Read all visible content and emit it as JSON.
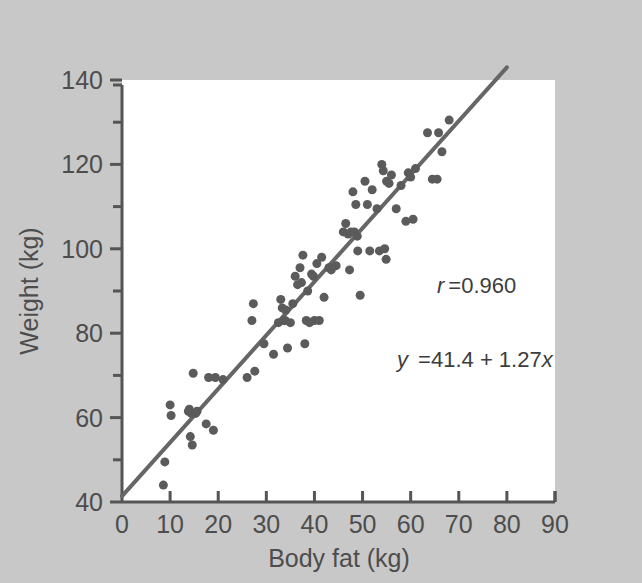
{
  "figure": {
    "name": "body-fat-vs-weight-scatterplot",
    "background_color": "#c8c8c8",
    "plot_background_color": "#ffffff",
    "point_color": "#5b5b5b",
    "line_color": "#666666",
    "axis_color": "#555555"
  },
  "annotations": {
    "correlation": "r =0.960",
    "correlation_symbol": "r",
    "correlation_value": "=0.960",
    "regression_equation": "y =41.4 + 1.27x",
    "regression_y": "y",
    "regression_rest": " =41.4 + 1.27",
    "regression_x": "x"
  },
  "chart_data": {
    "type": "scatter",
    "title": "",
    "xlabel": "Body fat (kg)",
    "ylabel": "Weight (kg)",
    "xlim": [
      0,
      90
    ],
    "ylim": [
      40,
      140
    ],
    "xticks": [
      0,
      10,
      20,
      30,
      40,
      50,
      60,
      70,
      80,
      90
    ],
    "xtick_labels": [
      "0",
      "10",
      "20",
      "30",
      "40",
      "50",
      "60",
      "70",
      "80",
      "90"
    ],
    "yticks": [
      40,
      60,
      80,
      100,
      120,
      140
    ],
    "ytick_labels": [
      "40",
      "60",
      "80",
      "100",
      "120",
      "140"
    ],
    "y_minor_ticks": [
      50,
      70,
      90,
      110,
      130
    ],
    "grid": false,
    "legend": false,
    "correlation_r": 0.96,
    "regression": {
      "intercept": 41.4,
      "slope": 1.27,
      "x_start": 0,
      "x_end": 80,
      "equation": "y = 41.4 + 1.27x"
    },
    "marker_size_px": 9,
    "n_points": 86,
    "points": [
      [
        8.6,
        44.0
      ],
      [
        8.9,
        49.5
      ],
      [
        10.0,
        63.0
      ],
      [
        10.2,
        60.5
      ],
      [
        13.8,
        61.5
      ],
      [
        14.0,
        62.0
      ],
      [
        14.2,
        55.5
      ],
      [
        14.4,
        61.0
      ],
      [
        14.6,
        53.5
      ],
      [
        14.8,
        70.5
      ],
      [
        15.3,
        61.0
      ],
      [
        15.6,
        61.5
      ],
      [
        17.5,
        58.5
      ],
      [
        18.0,
        69.5
      ],
      [
        19.0,
        57.0
      ],
      [
        19.4,
        69.5
      ],
      [
        21.0,
        69.0
      ],
      [
        26.0,
        69.5
      ],
      [
        27.0,
        83.0
      ],
      [
        27.3,
        87.0
      ],
      [
        27.6,
        71.0
      ],
      [
        29.5,
        77.5
      ],
      [
        31.5,
        75.0
      ],
      [
        32.5,
        82.5
      ],
      [
        33.0,
        88.0
      ],
      [
        33.3,
        86.0
      ],
      [
        33.6,
        83.0
      ],
      [
        33.9,
        83.0
      ],
      [
        34.0,
        85.5
      ],
      [
        34.4,
        76.5
      ],
      [
        35.0,
        82.5
      ],
      [
        35.5,
        87.0
      ],
      [
        36.0,
        93.5
      ],
      [
        36.5,
        91.5
      ],
      [
        37.0,
        95.5
      ],
      [
        37.3,
        92.0
      ],
      [
        37.6,
        98.5
      ],
      [
        38.0,
        77.5
      ],
      [
        38.3,
        83.0
      ],
      [
        38.6,
        90.0
      ],
      [
        39.0,
        82.5
      ],
      [
        39.4,
        94.0
      ],
      [
        39.8,
        93.5
      ],
      [
        40.0,
        83.0
      ],
      [
        40.5,
        96.5
      ],
      [
        41.0,
        83.0
      ],
      [
        41.5,
        98.0
      ],
      [
        42.0,
        88.5
      ],
      [
        43.0,
        95.5
      ],
      [
        43.5,
        95.0
      ],
      [
        44.5,
        96.0
      ],
      [
        46.0,
        104.0
      ],
      [
        46.5,
        106.0
      ],
      [
        47.0,
        103.5
      ],
      [
        47.3,
        95.0
      ],
      [
        47.6,
        104.0
      ],
      [
        48.0,
        113.5
      ],
      [
        48.3,
        104.0
      ],
      [
        48.6,
        110.5
      ],
      [
        48.9,
        103.0
      ],
      [
        49.0,
        99.5
      ],
      [
        49.5,
        89.0
      ],
      [
        50.5,
        116.0
      ],
      [
        51.0,
        110.5
      ],
      [
        51.5,
        99.5
      ],
      [
        52.0,
        114.0
      ],
      [
        53.0,
        109.5
      ],
      [
        53.5,
        99.5
      ],
      [
        54.0,
        120.0
      ],
      [
        54.3,
        118.5
      ],
      [
        54.6,
        100.0
      ],
      [
        54.9,
        97.5
      ],
      [
        55.0,
        116.0
      ],
      [
        55.5,
        115.5
      ],
      [
        56.0,
        117.5
      ],
      [
        57.0,
        109.5
      ],
      [
        58.0,
        115.0
      ],
      [
        59.0,
        106.5
      ],
      [
        59.5,
        118.0
      ],
      [
        60.0,
        117.0
      ],
      [
        60.5,
        107.0
      ],
      [
        61.0,
        119.0
      ],
      [
        63.5,
        127.5
      ],
      [
        64.5,
        116.5
      ],
      [
        65.5,
        116.5
      ],
      [
        65.8,
        127.5
      ],
      [
        66.5,
        123.0
      ],
      [
        68.0,
        130.5
      ]
    ]
  }
}
